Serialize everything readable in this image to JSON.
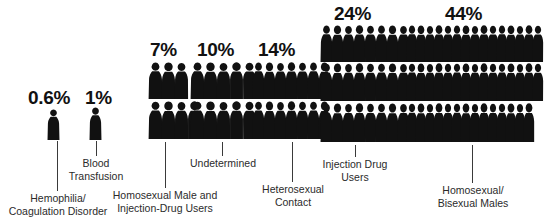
{
  "figure": {
    "background_color": "#ffffff",
    "figure_color": "#111111",
    "leader_line_color": "#3a3a3a"
  },
  "chart_data": {
    "type": "bar",
    "subtype": "pictogram",
    "title": "",
    "xlabel": "",
    "ylabel": "",
    "unit": "percent",
    "glyph": "human-figure-silhouette",
    "categories": [
      "Hemophilia/\nCoagulation Disorder",
      "Blood\nTransfusion",
      "Homosexual Male and\nInjection-Drug Users",
      "Undetermined",
      "Heterosexual\nContact",
      "Injection Drug\nUsers",
      "Homosexual/\nBisexual Males"
    ],
    "values": [
      0.6,
      1,
      7,
      10,
      14,
      24,
      44
    ],
    "value_labels": [
      "0.6%",
      "1%",
      "7%",
      "10%",
      "14%",
      "24%",
      "44%"
    ]
  },
  "groups": [
    {
      "id": "hemophilia",
      "name": "hemophilia-coagulation-disorder",
      "value_label": "0.6%",
      "caption": "Hemophilia/\nCoagulation Disorder",
      "rows": [
        1
      ]
    },
    {
      "id": "blood-transfusion",
      "name": "blood-transfusion",
      "value_label": "1%",
      "caption": "Blood\nTransfusion",
      "rows": [
        1
      ]
    },
    {
      "id": "homosexual-male-idu",
      "name": "homosexual-male-and-injection-drug-users",
      "value_label": "7%",
      "caption": "Homosexual Male and\nInjection-Drug Users",
      "rows": [
        3,
        4
      ]
    },
    {
      "id": "undetermined",
      "name": "undetermined",
      "value_label": "10%",
      "caption": "Undetermined",
      "rows": [
        5,
        5
      ]
    },
    {
      "id": "heterosexual-contact",
      "name": "heterosexual-contact",
      "value_label": "14%",
      "caption": "Heterosexual\nContact",
      "rows": [
        7,
        7
      ]
    },
    {
      "id": "injection-drug-users",
      "name": "injection-drug-users",
      "value_label": "24%",
      "caption": "Injection Drug\nUsers",
      "rows": [
        8,
        8,
        8
      ]
    },
    {
      "id": "homosexual-bisexual-males",
      "name": "homosexual-bisexual-males",
      "value_label": "44%",
      "caption": "Homosexual/\nBisexual Males",
      "rows": [
        15,
        15,
        14
      ]
    }
  ]
}
